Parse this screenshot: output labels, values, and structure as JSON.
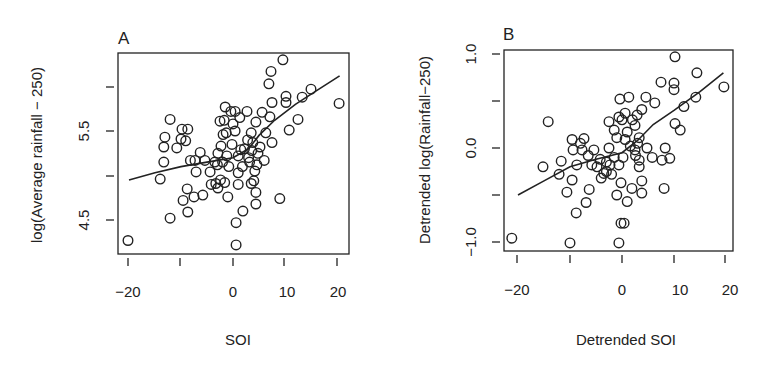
{
  "panels": [
    {
      "label": "A",
      "xlabel": "SOI",
      "ylabel": "log(Average rainfall − 250)",
      "xticks": [
        "−20",
        "",
        "0",
        "10",
        "20"
      ],
      "yticks": [
        "4.5",
        "",
        "5.5",
        ""
      ]
    },
    {
      "label": "B",
      "xlabel": "Detrended SOI",
      "ylabel": "Detrended log(Rainfall−250)",
      "xticks": [
        "−20",
        "",
        "0",
        "10",
        "20"
      ],
      "yticks": [
        "−1.0",
        "",
        "0.0",
        "",
        "1.0"
      ]
    }
  ],
  "chart_data": [
    {
      "type": "scatter",
      "title": "A",
      "xlabel": "SOI",
      "ylabel": "log(Average rainfall − 250)",
      "xlim": [
        -21,
        22
      ],
      "ylim": [
        4.2,
        6.35
      ],
      "xticks": [
        -20,
        -10,
        0,
        10,
        20
      ],
      "xtick_labels": [
        "−20",
        "",
        "0",
        "10",
        "20"
      ],
      "yticks": [
        4.5,
        5.0,
        5.5,
        6.0
      ],
      "ytick_labels": [
        "4.5",
        "",
        "5.5",
        ""
      ],
      "grid": false,
      "legend": null,
      "points": [
        [
          -20.2,
          4.27
        ],
        [
          -12.1,
          4.52
        ],
        [
          -14.0,
          4.96
        ],
        [
          -13.3,
          5.15
        ],
        [
          -13.3,
          5.32
        ],
        [
          -13.1,
          5.43
        ],
        [
          -12.1,
          5.63
        ],
        [
          -10.0,
          5.41
        ],
        [
          -10.8,
          5.31
        ],
        [
          -9.8,
          5.52
        ],
        [
          -8.7,
          5.52
        ],
        [
          -9.1,
          5.39
        ],
        [
          -8.2,
          5.17
        ],
        [
          -7.3,
          5.17
        ],
        [
          -6.3,
          5.26
        ],
        [
          -7.1,
          5.04
        ],
        [
          -8.8,
          4.85
        ],
        [
          -9.6,
          4.72
        ],
        [
          -7.5,
          4.76
        ],
        [
          -5.8,
          4.78
        ],
        [
          -8.7,
          4.59
        ],
        [
          -5.4,
          5.17
        ],
        [
          -4.4,
          5.04
        ],
        [
          -3.5,
          5.15
        ],
        [
          -4.2,
          4.9
        ],
        [
          -3.3,
          4.91
        ],
        [
          -2.9,
          4.86
        ],
        [
          -1.0,
          4.76
        ],
        [
          -1.5,
          5.77
        ],
        [
          -2.5,
          5.61
        ],
        [
          -1.9,
          5.46
        ],
        [
          -2.3,
          5.33
        ],
        [
          -2.9,
          5.25
        ],
        [
          -0.4,
          5.72
        ],
        [
          -1.7,
          5.62
        ],
        [
          -1.3,
          5.48
        ],
        [
          -2.0,
          5.15
        ],
        [
          -1.2,
          5.22
        ],
        [
          -0.8,
          5.1
        ],
        [
          -3.0,
          5.12
        ],
        [
          -2.4,
          4.95
        ],
        [
          -1.6,
          4.92
        ],
        [
          9.6,
          6.3
        ],
        [
          7.3,
          6.17
        ],
        [
          6.9,
          6.03
        ],
        [
          7.5,
          5.82
        ],
        [
          10.2,
          5.89
        ],
        [
          10.2,
          5.82
        ],
        [
          13.3,
          5.88
        ],
        [
          15.0,
          5.97
        ],
        [
          20.4,
          5.81
        ],
        [
          12.5,
          5.63
        ],
        [
          10.8,
          5.51
        ],
        [
          9.0,
          4.74
        ],
        [
          7.5,
          5.37
        ],
        [
          7.1,
          5.66
        ],
        [
          5.6,
          5.71
        ],
        [
          6.3,
          5.48
        ],
        [
          6.0,
          5.17
        ],
        [
          4.4,
          4.81
        ],
        [
          4.4,
          4.68
        ],
        [
          4.0,
          4.94
        ],
        [
          4.2,
          5.05
        ],
        [
          3.5,
          4.91
        ],
        [
          4.8,
          5.25
        ],
        [
          3.8,
          5.37
        ],
        [
          3.5,
          5.48
        ],
        [
          4.4,
          5.6
        ],
        [
          2.7,
          5.72
        ],
        [
          1.9,
          4.6
        ],
        [
          0.6,
          4.47
        ],
        [
          0.6,
          4.22
        ],
        [
          1.3,
          5.65
        ],
        [
          1.5,
          5.29
        ],
        [
          1.0,
          5.22
        ],
        [
          1.0,
          5.03
        ],
        [
          1.0,
          4.9
        ],
        [
          0.4,
          5.5
        ],
        [
          0.4,
          5.72
        ],
        [
          2.2,
          5.3
        ],
        [
          3.0,
          5.2
        ],
        [
          2.8,
          5.4
        ],
        [
          3.6,
          5.28
        ],
        [
          0.0,
          5.58
        ],
        [
          1.8,
          5.1
        ],
        [
          -0.2,
          5.35
        ],
        [
          3.2,
          5.15
        ],
        [
          4.6,
          5.12
        ],
        [
          5.2,
          5.32
        ]
      ],
      "fit_line": [
        [
          -20,
          4.95
        ],
        [
          -15,
          5.03
        ],
        [
          -10,
          5.1
        ],
        [
          -5,
          5.15
        ],
        [
          0,
          5.2
        ],
        [
          3,
          5.3
        ],
        [
          5,
          5.45
        ],
        [
          8,
          5.62
        ],
        [
          12,
          5.8
        ],
        [
          16,
          5.95
        ],
        [
          20.5,
          6.12
        ]
      ]
    },
    {
      "type": "scatter",
      "title": "B",
      "xlabel": "Detrended SOI",
      "ylabel": "Detrended log(Rainfall−250)",
      "xlim": [
        -22,
        22
      ],
      "ylim": [
        -1.1,
        1.05
      ],
      "xticks": [
        -20,
        -10,
        0,
        10,
        20
      ],
      "xtick_labels": [
        "−20",
        "",
        "0",
        "10",
        "20"
      ],
      "yticks": [
        -1.0,
        -0.5,
        0.0,
        0.5,
        1.0
      ],
      "ytick_labels": [
        "−1.0",
        "",
        "0.0",
        "",
        "1.0"
      ],
      "grid": false,
      "legend": null,
      "points": [
        [
          -21.2,
          -0.96
        ],
        [
          -10.0,
          -1.01
        ],
        [
          -14.2,
          0.28
        ],
        [
          -15.2,
          -0.2
        ],
        [
          -11.7,
          -0.14
        ],
        [
          -12.1,
          -0.28
        ],
        [
          -9.6,
          -0.34
        ],
        [
          -10.6,
          -0.47
        ],
        [
          -6.3,
          -0.44
        ],
        [
          -6.9,
          -0.58
        ],
        [
          -8.8,
          -0.69
        ],
        [
          -9.6,
          0.09
        ],
        [
          -7.3,
          0.1
        ],
        [
          -9.4,
          -0.02
        ],
        [
          -7.7,
          -0.02
        ],
        [
          -5.4,
          -0.02
        ],
        [
          -8.7,
          -0.18
        ],
        [
          -5.8,
          -0.18
        ],
        [
          -4.8,
          -0.2
        ],
        [
          -2.5,
          0.0
        ],
        [
          -3.5,
          -0.27
        ],
        [
          -4.0,
          -0.32
        ],
        [
          -2.3,
          -0.18
        ],
        [
          -0.6,
          -0.18
        ],
        [
          -0.2,
          -0.37
        ],
        [
          -0.2,
          -0.8
        ],
        [
          -0.6,
          -1.01
        ],
        [
          -1.0,
          -0.5
        ],
        [
          -0.4,
          0.52
        ],
        [
          -1.5,
          0.19
        ],
        [
          -2.5,
          0.28
        ],
        [
          -0.6,
          0.33
        ],
        [
          -1.0,
          0.11
        ],
        [
          -3.0,
          -0.25
        ],
        [
          -2.0,
          -0.28
        ],
        [
          -1.5,
          -0.1
        ],
        [
          -8.0,
          0.05
        ],
        [
          -6.5,
          -0.08
        ],
        [
          -4.2,
          -0.12
        ],
        [
          -3.0,
          -0.15
        ],
        [
          10.2,
          0.97
        ],
        [
          14.4,
          0.8
        ],
        [
          19.6,
          0.65
        ],
        [
          10.0,
          0.69
        ],
        [
          10.0,
          0.62
        ],
        [
          7.5,
          0.7
        ],
        [
          14.2,
          0.54
        ],
        [
          11.9,
          0.44
        ],
        [
          10.2,
          0.26
        ],
        [
          11.2,
          0.19
        ],
        [
          6.3,
          0.48
        ],
        [
          4.6,
          0.54
        ],
        [
          8.3,
          0.0
        ],
        [
          9.2,
          -0.11
        ],
        [
          7.7,
          -0.13
        ],
        [
          5.8,
          -0.1
        ],
        [
          4.8,
          0.0
        ],
        [
          8.1,
          -0.43
        ],
        [
          3.8,
          -0.35
        ],
        [
          3.8,
          -0.48
        ],
        [
          1.9,
          -0.43
        ],
        [
          1.0,
          -0.57
        ],
        [
          0.4,
          -0.8
        ],
        [
          3.8,
          0.41
        ],
        [
          2.9,
          0.35
        ],
        [
          0.6,
          0.37
        ],
        [
          1.0,
          0.17
        ],
        [
          2.5,
          0.24
        ],
        [
          3.3,
          0.11
        ],
        [
          2.5,
          -0.02
        ],
        [
          3.3,
          -0.13
        ],
        [
          3.3,
          -0.2
        ],
        [
          0.6,
          0.09
        ],
        [
          1.3,
          0.54
        ],
        [
          2.0,
          0.3
        ],
        [
          3.0,
          0.05
        ],
        [
          1.6,
          0.02
        ],
        [
          0.0,
          0.3
        ],
        [
          2.6,
          -0.08
        ],
        [
          0.2,
          -0.1
        ]
      ],
      "fit_line": [
        [
          -20,
          -0.5
        ],
        [
          -15,
          -0.35
        ],
        [
          -10,
          -0.2
        ],
        [
          -5,
          -0.12
        ],
        [
          0,
          -0.05
        ],
        [
          3,
          0.08
        ],
        [
          6,
          0.25
        ],
        [
          10,
          0.4
        ],
        [
          15,
          0.6
        ],
        [
          19.5,
          0.8
        ]
      ]
    }
  ]
}
